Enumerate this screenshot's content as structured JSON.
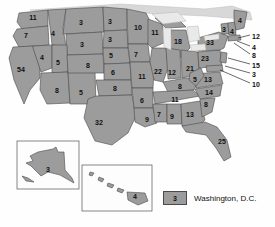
{
  "map": {
    "title": "United States Electoral Votes Map",
    "fill_color": "#9c9c9c",
    "border_color": "#4a4a4a",
    "lake_color": "#e9e9e9",
    "states": [
      {
        "code": "WA",
        "value": "11",
        "x": 33,
        "y": 17
      },
      {
        "code": "OR",
        "value": "7",
        "x": 26,
        "y": 35
      },
      {
        "code": "CA",
        "value": "54",
        "x": 21,
        "y": 69
      },
      {
        "code": "NV",
        "value": "4",
        "x": 42,
        "y": 57
      },
      {
        "code": "ID",
        "value": "4",
        "x": 53,
        "y": 33
      },
      {
        "code": "MT",
        "value": "3",
        "x": 81,
        "y": 22
      },
      {
        "code": "WY",
        "value": "3",
        "x": 82,
        "y": 44
      },
      {
        "code": "UT",
        "value": "5",
        "x": 58,
        "y": 62
      },
      {
        "code": "AZ",
        "value": "8",
        "x": 57,
        "y": 90
      },
      {
        "code": "NM",
        "value": "5",
        "x": 81,
        "y": 92
      },
      {
        "code": "CO",
        "value": "8",
        "x": 88,
        "y": 65
      },
      {
        "code": "ND",
        "value": "3",
        "x": 110,
        "y": 21
      },
      {
        "code": "SD",
        "value": "3",
        "x": 110,
        "y": 39
      },
      {
        "code": "NE",
        "value": "5",
        "x": 111,
        "y": 55
      },
      {
        "code": "KS",
        "value": "6",
        "x": 113,
        "y": 72
      },
      {
        "code": "OK",
        "value": "8",
        "x": 115,
        "y": 88
      },
      {
        "code": "TX",
        "value": "32",
        "x": 99,
        "y": 122
      },
      {
        "code": "MN",
        "value": "10",
        "x": 138,
        "y": 27
      },
      {
        "code": "IA",
        "value": "7",
        "x": 136,
        "y": 54
      },
      {
        "code": "MO",
        "value": "11",
        "x": 142,
        "y": 76
      },
      {
        "code": "AR",
        "value": "6",
        "x": 142,
        "y": 100
      },
      {
        "code": "LA",
        "value": "9",
        "x": 147,
        "y": 119
      },
      {
        "code": "WI",
        "value": "11",
        "x": 155,
        "y": 32
      },
      {
        "code": "IL",
        "value": "22",
        "x": 158,
        "y": 71
      },
      {
        "code": "MI",
        "value": "18",
        "x": 178,
        "y": 41
      },
      {
        "code": "IN",
        "value": "12",
        "x": 172,
        "y": 72
      },
      {
        "code": "OH",
        "value": "21",
        "x": 190,
        "y": 68
      },
      {
        "code": "KY",
        "value": "8",
        "x": 180,
        "y": 86
      },
      {
        "code": "TN",
        "value": "11",
        "x": 175,
        "y": 99
      },
      {
        "code": "MS",
        "value": "7",
        "x": 159,
        "y": 114
      },
      {
        "code": "AL",
        "value": "9",
        "x": 172,
        "y": 116
      },
      {
        "code": "GA",
        "value": "13",
        "x": 190,
        "y": 114
      },
      {
        "code": "FL",
        "value": "25",
        "x": 222,
        "y": 141
      },
      {
        "code": "SC",
        "value": "8",
        "x": 206,
        "y": 104
      },
      {
        "code": "NC",
        "value": "14",
        "x": 209,
        "y": 92
      },
      {
        "code": "VA",
        "value": "13",
        "x": 208,
        "y": 79
      },
      {
        "code": "WV",
        "value": "5",
        "x": 195,
        "y": 79
      },
      {
        "code": "PA",
        "value": "23",
        "x": 205,
        "y": 58
      },
      {
        "code": "NY",
        "value": "33",
        "x": 210,
        "y": 42
      },
      {
        "code": "VT",
        "value": "3",
        "x": 224,
        "y": 29
      },
      {
        "code": "NH",
        "value": "4",
        "x": 232,
        "y": 31
      },
      {
        "code": "ME",
        "value": "4",
        "x": 240,
        "y": 20
      }
    ],
    "leader_labels": [
      {
        "code": "MA",
        "value": "12",
        "x": 252,
        "y": 36
      },
      {
        "code": "RI",
        "value": "4",
        "x": 252,
        "y": 47
      },
      {
        "code": "CT",
        "value": "8",
        "x": 252,
        "y": 55
      },
      {
        "code": "NJ",
        "value": "15",
        "x": 252,
        "y": 65
      },
      {
        "code": "DE",
        "value": "3",
        "x": 252,
        "y": 74
      },
      {
        "code": "MD",
        "value": "10",
        "x": 252,
        "y": 84
      }
    ],
    "insets": [
      {
        "name": "alaska",
        "value": "3",
        "label_x": 48,
        "label_y": 169
      },
      {
        "name": "hawaii",
        "value": "4",
        "label_x": 135,
        "label_y": 196
      }
    ]
  },
  "legend": {
    "swatch_value": "3",
    "label": "Washington, D.C.",
    "swatch_color": "#9c9c9c"
  }
}
